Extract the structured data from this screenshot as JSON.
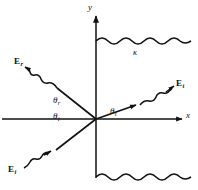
{
  "figure": {
    "background": "#ffffff",
    "ink_color": "#111111",
    "width": 198,
    "height": 190
  },
  "axes": {
    "x_label": "x",
    "y_label": "y",
    "origin": {
      "x": 96,
      "y": 119
    },
    "x_axis": {
      "x1": 2,
      "y1": 119,
      "x2": 184,
      "y2": 119,
      "arrow": "right"
    },
    "y_axis": {
      "x1": 96,
      "y1": 178,
      "x2": 96,
      "y2": 13,
      "arrow": "up"
    }
  },
  "medium": {
    "label": "κ",
    "label_name": "kappa",
    "description": "dielectric constant of right-hand medium"
  },
  "interface": {
    "top_wavy": {
      "x_start": 96,
      "x_end": 191,
      "y": 41
    },
    "bottom_wavy": {
      "x_start": 96,
      "x_end": 191,
      "y": 177
    }
  },
  "rays": [
    {
      "name": "reflected",
      "field_label": "E",
      "field_subscript": "r",
      "angle_label": "θ",
      "angle_subscript": "r",
      "direction": "up-left from origin",
      "angle_deg": 38
    },
    {
      "name": "incident",
      "field_label": "E",
      "field_subscript": "i",
      "angle_label": "θ",
      "angle_subscript": "i",
      "direction": "from lower-left toward origin",
      "angle_deg": 38
    },
    {
      "name": "transmitted",
      "field_label": "E",
      "field_subscript": "t",
      "angle_label": "θ",
      "angle_subscript": "t",
      "direction": "up-right from origin",
      "angle_deg": 15
    }
  ],
  "labels": {
    "y_axis": "y",
    "x_axis": "x",
    "kappa": "κ",
    "E_reflected": "E",
    "E_reflected_sub": "r",
    "E_incident": "E",
    "E_incident_sub": "i",
    "E_transmitted": "E",
    "E_transmitted_sub": "t",
    "theta_reflected": "θ",
    "theta_reflected_sub": "r",
    "theta_incident": "θ",
    "theta_incident_sub": "i",
    "theta_transmitted": "θ",
    "theta_transmitted_sub": "t"
  }
}
